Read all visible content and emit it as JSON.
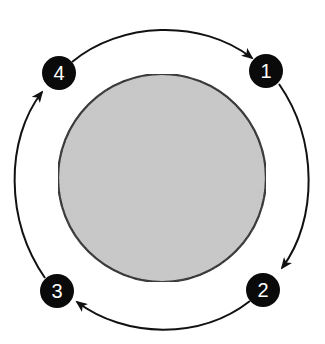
{
  "diagram": {
    "type": "cycle",
    "center_body": {
      "shape": "circle",
      "fill": "#c9c9c9",
      "stroke": "#111111",
      "cx": 162,
      "cy": 178,
      "r": 104
    },
    "orbit": {
      "cx": 162.5,
      "cy": 177.5,
      "rx": 146.5,
      "ry": 151.5,
      "stroke": "#111111",
      "direction": "clockwise"
    },
    "nodes": [
      {
        "id": "1",
        "label": "1",
        "cx": 266,
        "cy": 71,
        "r": 17
      },
      {
        "id": "2",
        "label": "2",
        "cx": 263,
        "cy": 290,
        "r": 17
      },
      {
        "id": "3",
        "label": "3",
        "cx": 57,
        "cy": 291,
        "r": 17
      },
      {
        "id": "4",
        "label": "4",
        "cx": 59,
        "cy": 73,
        "r": 17
      }
    ],
    "arrows": [
      {
        "from": "1",
        "to": "2"
      },
      {
        "from": "2",
        "to": "3"
      },
      {
        "from": "3",
        "to": "4"
      },
      {
        "from": "4",
        "to": "1"
      }
    ],
    "node_fill": "#0a0a0a",
    "label_color": "#ffffff"
  }
}
